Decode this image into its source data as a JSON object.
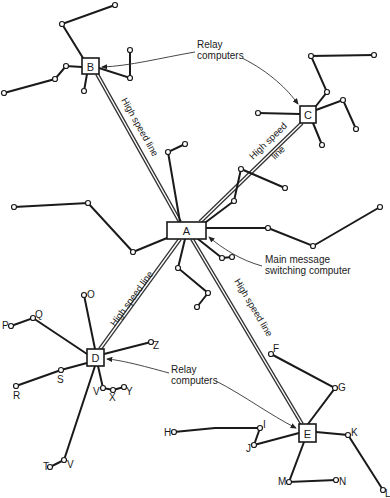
{
  "diagram": {
    "computers": {
      "A": {
        "label": "A",
        "x": 167,
        "y": 222,
        "w": 39,
        "h": 17
      },
      "B": {
        "label": "B",
        "x": 82,
        "y": 58,
        "w": 17,
        "h": 16
      },
      "C": {
        "label": "C",
        "x": 300,
        "y": 106,
        "w": 16,
        "h": 17
      },
      "D": {
        "label": "D",
        "x": 87,
        "y": 349,
        "w": 17,
        "h": 17
      },
      "E": {
        "label": "E",
        "x": 299,
        "y": 424,
        "w": 17,
        "h": 18
      }
    },
    "high_speed_lines": [
      {
        "from": "A",
        "to": "B",
        "label": "High speed line"
      },
      {
        "from": "A",
        "to": "C",
        "label": "High speed line"
      },
      {
        "from": "A",
        "to": "D",
        "label": "High speed line"
      },
      {
        "from": "A",
        "to": "E",
        "label": "High speed line"
      }
    ],
    "annotations": {
      "relay_top_line1": "Relay",
      "relay_top_line2": "computers",
      "main_line1": "Main message",
      "main_line2": "switching computer",
      "relay_bottom_line1": "Relay",
      "relay_bottom_line2": "computers",
      "hs_AB": "High speed line",
      "hs_AC_line1": "High speed",
      "hs_AC_line2": "line",
      "hs_AD": "High speed line",
      "hs_AE": "High speed line"
    },
    "terminal_labels": {
      "O": "O",
      "P": "P",
      "Q": "Q",
      "R": "R",
      "S": "S",
      "T": "T",
      "V1": "V",
      "V2": "V",
      "X": "X",
      "Y": "Y",
      "Z": "Z",
      "F": "F",
      "G": "G",
      "H": "H",
      "I": "I",
      "J": "J",
      "K": "K",
      "L": "L",
      "M": "M",
      "N": "N"
    }
  }
}
